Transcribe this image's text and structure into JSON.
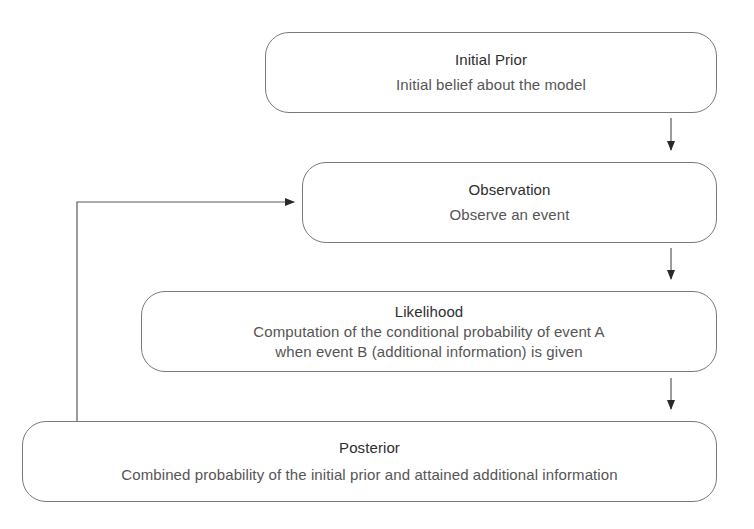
{
  "diagram": {
    "type": "flowchart",
    "nodes": [
      {
        "id": "initial-prior",
        "title": "Initial Prior",
        "description": "Initial belief about the model"
      },
      {
        "id": "observation",
        "title": "Observation",
        "description": "Observe an event"
      },
      {
        "id": "likelihood",
        "title": "Likelihood",
        "description": "Computation of the conditional probability of event A\nwhen event B (additional information) is given"
      },
      {
        "id": "posterior",
        "title": "Posterior",
        "description": "Combined probability of the initial prior and attained additional information"
      }
    ],
    "edges": [
      {
        "from": "initial-prior",
        "to": "observation"
      },
      {
        "from": "observation",
        "to": "likelihood"
      },
      {
        "from": "likelihood",
        "to": "posterior"
      },
      {
        "from": "posterior",
        "to": "observation",
        "style": "feedback-loop"
      }
    ],
    "colors": {
      "border": "#7a7a7a",
      "arrow": "#333333",
      "title_text": "#2e2e2e",
      "desc_text": "#555555",
      "background": "#ffffff"
    }
  }
}
